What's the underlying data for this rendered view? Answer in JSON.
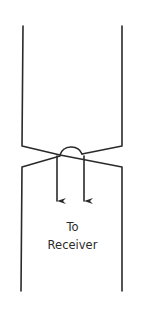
{
  "diagram": {
    "type": "waveguide-junction",
    "label_line1": "To",
    "label_line2": "Receiver",
    "colors": {
      "stroke": "#2a2a2a",
      "background": "#ffffff"
    },
    "arrows": [
      {
        "name": "left-arrow",
        "x": 57,
        "direction": "down"
      },
      {
        "name": "right-arrow",
        "x": 84,
        "direction": "down"
      }
    ]
  }
}
